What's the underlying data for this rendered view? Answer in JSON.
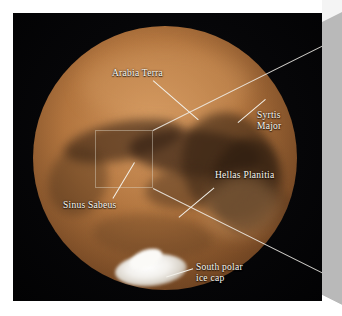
{
  "figure": {
    "background_color": "#050505",
    "planet_color": "#b0733d",
    "label_color": "#fbf9f2",
    "leader_line_color": "#f3f1ea",
    "fold_panel_color": "#b9b9b9"
  },
  "annotations": [
    {
      "id": "arabia-terra",
      "text": "Arabia Terra",
      "lines": [
        "Arabia Terra"
      ],
      "label_x": 112,
      "label_y": 68,
      "leader": {
        "x": 153,
        "y": 80,
        "length": 60,
        "angle": 41
      }
    },
    {
      "id": "syrtis-major",
      "text": "Syrtis Major",
      "lines": [
        "Syrtis",
        "Major"
      ],
      "label_x": 257,
      "label_y": 110,
      "leader": {
        "x": 238,
        "y": 122,
        "length": 36,
        "angle": -40
      }
    },
    {
      "id": "hellas-planitia",
      "text": "Hellas Planitia",
      "lines": [
        "Hellas Planitia"
      ],
      "label_x": 215,
      "label_y": 170,
      "leader": {
        "x": 214,
        "y": 187,
        "length": 46,
        "angle": 140
      }
    },
    {
      "id": "sinus-sabeus",
      "text": "Sinus Sabeus",
      "lines": [
        "Sinus Sabeus"
      ],
      "label_x": 63,
      "label_y": 200,
      "leader": {
        "x": 113,
        "y": 198,
        "length": 42,
        "angle": -59
      }
    },
    {
      "id": "south-polar-ice-cap",
      "text": "South polar ice cap",
      "lines": [
        "South polar",
        "ice cap"
      ],
      "label_x": 196,
      "label_y": 262,
      "leader": {
        "x": 193,
        "y": 268,
        "length": 28,
        "angle": 163
      }
    }
  ],
  "inset_region": {
    "name": "magnified-region-box",
    "x": 95,
    "y": 130,
    "width": 58,
    "height": 58
  }
}
